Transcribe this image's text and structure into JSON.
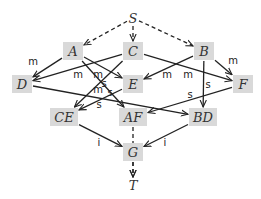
{
  "nodes": {
    "S": {
      "label": "S",
      "x": 133,
      "y": 18,
      "box": false
    },
    "A": {
      "label": "A",
      "x": 73,
      "y": 51,
      "box": true
    },
    "C": {
      "label": "C",
      "x": 133,
      "y": 51,
      "box": true
    },
    "B": {
      "label": "B",
      "x": 204,
      "y": 51,
      "box": true
    },
    "D": {
      "label": "D",
      "x": 22,
      "y": 84,
      "box": true
    },
    "E": {
      "label": "E",
      "x": 133,
      "y": 84,
      "box": true
    },
    "F": {
      "label": "F",
      "x": 243,
      "y": 84,
      "box": true
    },
    "CE": {
      "label": "CE",
      "x": 64,
      "y": 117,
      "box": true
    },
    "AF": {
      "label": "AF",
      "x": 133,
      "y": 117,
      "box": true
    },
    "BD": {
      "label": "BD",
      "x": 203,
      "y": 117,
      "box": true
    },
    "G": {
      "label": "G",
      "x": 133,
      "y": 152,
      "box": true
    },
    "T": {
      "label": "T",
      "x": 133,
      "y": 185,
      "box": false
    }
  },
  "edges": [
    {
      "from": "S",
      "to": "A",
      "style": "dashed",
      "label": ""
    },
    {
      "from": "S",
      "to": "C",
      "style": "dashed",
      "label": ""
    },
    {
      "from": "S",
      "to": "B",
      "style": "dashed",
      "label": ""
    },
    {
      "from": "A",
      "to": "D",
      "style": "solid",
      "label": "m"
    },
    {
      "from": "A",
      "to": "E",
      "style": "solid",
      "label": "m"
    },
    {
      "from": "A",
      "to": "AF",
      "style": "solid",
      "label": "s"
    },
    {
      "from": "C",
      "to": "D",
      "style": "solid",
      "label": "m"
    },
    {
      "from": "C",
      "to": "F",
      "style": "solid",
      "label": "m"
    },
    {
      "from": "C",
      "to": "CE",
      "style": "solid",
      "label": "m"
    },
    {
      "from": "B",
      "to": "E",
      "style": "solid",
      "label": "m"
    },
    {
      "from": "B",
      "to": "F",
      "style": "solid",
      "label": "m"
    },
    {
      "from": "B",
      "to": "BD",
      "style": "solid",
      "label": "s"
    },
    {
      "from": "D",
      "to": "BD",
      "style": "solid",
      "label": ""
    },
    {
      "from": "E",
      "to": "CE",
      "style": "solid",
      "label": "s"
    },
    {
      "from": "F",
      "to": "AF",
      "style": "solid",
      "label": "s"
    },
    {
      "from": "CE",
      "to": "G",
      "style": "solid",
      "label": "i"
    },
    {
      "from": "BD",
      "to": "G",
      "style": "solid",
      "label": "i"
    },
    {
      "from": "AF",
      "to": "T",
      "style": "dashed",
      "label": ""
    },
    {
      "from": "G",
      "to": "T",
      "style": "dashed",
      "label": ""
    }
  ],
  "edge_labels": [
    {
      "text": "m",
      "x": 33,
      "y": 65
    },
    {
      "text": "m",
      "x": 78,
      "y": 78
    },
    {
      "text": "m",
      "x": 98,
      "y": 78
    },
    {
      "text": "s",
      "x": 104,
      "y": 87
    },
    {
      "text": "m",
      "x": 98,
      "y": 93
    },
    {
      "text": "s",
      "x": 110,
      "y": 96
    },
    {
      "text": "m",
      "x": 167,
      "y": 78
    },
    {
      "text": "m",
      "x": 188,
      "y": 78
    },
    {
      "text": "m",
      "x": 233,
      "y": 64
    },
    {
      "text": "s",
      "x": 208,
      "y": 88
    },
    {
      "text": "s",
      "x": 190,
      "y": 98
    },
    {
      "text": "s",
      "x": 99,
      "y": 108
    },
    {
      "text": "i",
      "x": 99,
      "y": 146
    },
    {
      "text": "i",
      "x": 165,
      "y": 146
    }
  ]
}
